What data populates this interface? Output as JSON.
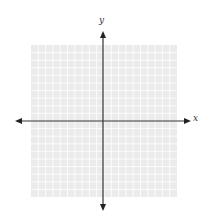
{
  "diagram": {
    "type": "coordinate-plane",
    "axes": {
      "x_label": "x",
      "y_label": "y",
      "arrows": "both-ends"
    },
    "grid": {
      "columns": 20,
      "rows": 20,
      "fill_color": "#ebebeb",
      "line_color": "#ffffff"
    },
    "colors": {
      "axis": "#333333",
      "background": "#ffffff"
    }
  }
}
